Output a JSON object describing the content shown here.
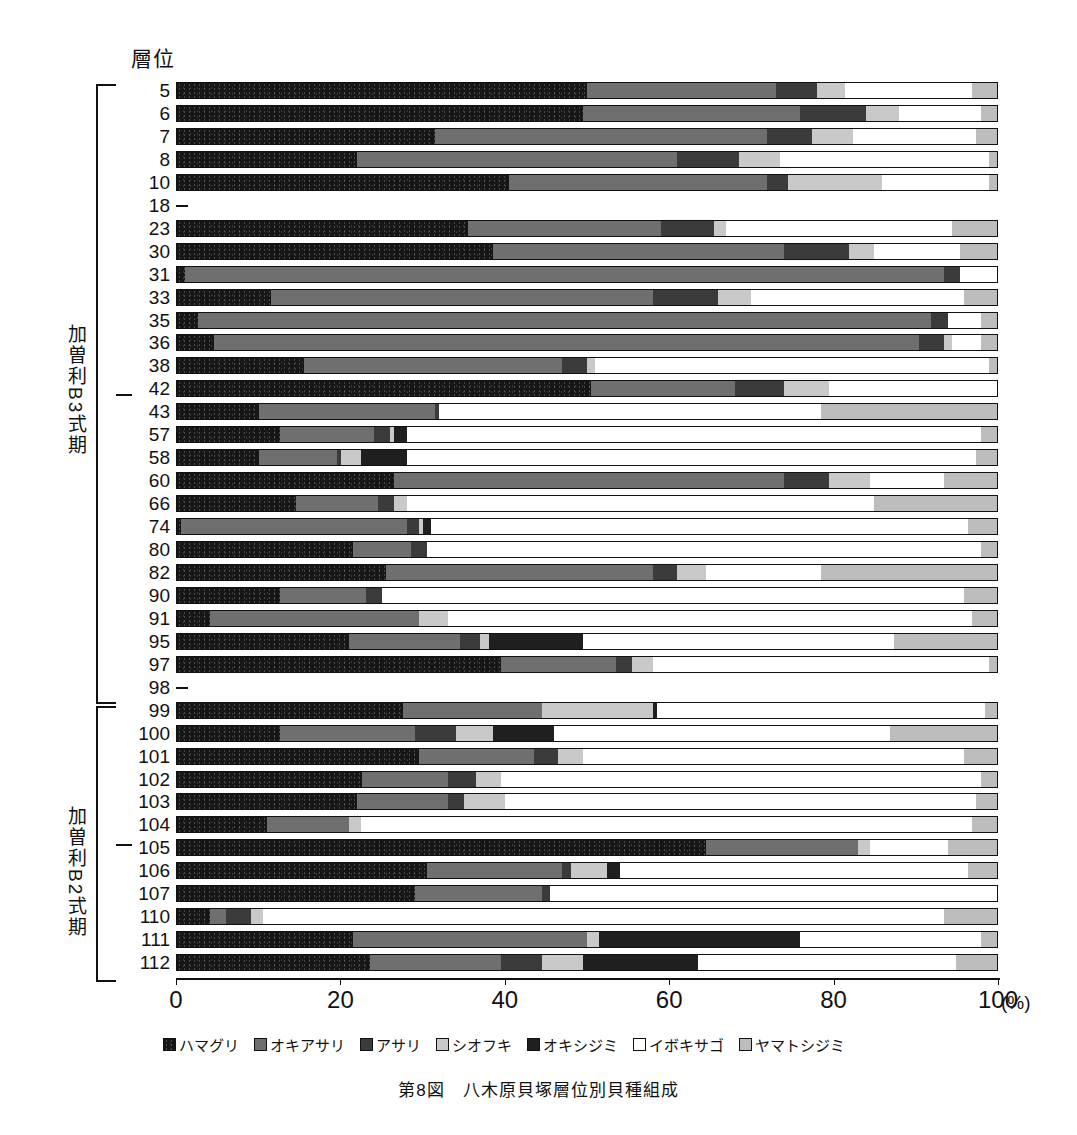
{
  "figure": {
    "axis_title": "層位",
    "caption": "第8図　八木原貝塚層位別貝種組成",
    "x_unit": "(%)"
  },
  "periods": [
    {
      "id": "kasori-b3",
      "label": "加曽利B3式期"
    },
    {
      "id": "kasori-b2",
      "label": "加曽利B2式期"
    }
  ],
  "axis": {
    "ticks": [
      "0",
      "20",
      "40",
      "60",
      "80",
      "100"
    ],
    "tick_values": [
      0,
      20,
      40,
      60,
      80,
      100
    ]
  },
  "legend": [
    {
      "name": "ハマグリ",
      "color": "#161616"
    },
    {
      "name": "オキアサリ",
      "color": "#6f6f6f"
    },
    {
      "name": "アサリ",
      "color": "#3b3b3b"
    },
    {
      "name": "シオフキ",
      "color": "#c9c9c9"
    },
    {
      "name": "オキシジミ",
      "color": "#1f1f1f"
    },
    {
      "name": "イボキサゴ",
      "color": "#ffffff"
    },
    {
      "name": "ヤマトシジミ",
      "color": "#bdbdbd"
    }
  ],
  "chart_data": {
    "type": "bar",
    "orientation": "horizontal",
    "stacked": true,
    "normalized_percent": true,
    "title": "第8図　八木原貝塚層位別貝種組成",
    "xlabel": "(%)",
    "ylabel": "層位",
    "xlim": [
      0,
      100
    ],
    "grid": false,
    "legend_position": "bottom",
    "categories": [
      "5",
      "6",
      "7",
      "8",
      "10",
      "18",
      "23",
      "30",
      "31",
      "33",
      "35",
      "36",
      "38",
      "42",
      "43",
      "57",
      "58",
      "60",
      "66",
      "74",
      "80",
      "82",
      "90",
      "91",
      "95",
      "97",
      "98",
      "99",
      "100",
      "101",
      "102",
      "103",
      "104",
      "105",
      "106",
      "107",
      "110",
      "111",
      "112"
    ],
    "series": [
      {
        "name": "ハマグリ",
        "values": [
          50.0,
          49.5,
          31.5,
          22.0,
          40.5,
          0,
          35.5,
          38.5,
          1.0,
          11.5,
          2.5,
          4.5,
          15.5,
          50.5,
          10.0,
          12.5,
          10.0,
          26.5,
          14.5,
          0.5,
          21.5,
          25.5,
          12.5,
          4.0,
          21.0,
          39.5,
          0,
          27.5,
          12.5,
          29.5,
          22.5,
          22.0,
          11.0,
          64.5,
          30.5,
          29.0,
          4.0,
          21.5,
          23.5
        ]
      },
      {
        "name": "オキアサリ",
        "values": [
          23.0,
          26.5,
          40.5,
          39.0,
          31.5,
          0,
          23.5,
          35.5,
          92.5,
          46.5,
          89.5,
          86.0,
          31.5,
          17.5,
          21.5,
          11.5,
          9.5,
          47.5,
          10.0,
          27.5,
          7.0,
          32.5,
          10.5,
          25.5,
          13.5,
          14.0,
          0,
          17.0,
          16.5,
          14.0,
          10.5,
          11.0,
          10.0,
          18.5,
          16.5,
          15.5,
          2.0,
          28.5,
          16.0
        ]
      },
      {
        "name": "アサリ",
        "values": [
          5.0,
          8.0,
          5.5,
          7.5,
          2.5,
          0,
          6.5,
          8.0,
          2.0,
          8.0,
          2.0,
          3.0,
          3.0,
          6.0,
          0.5,
          2.0,
          0.5,
          5.5,
          2.0,
          1.5,
          2.0,
          3.0,
          2.0,
          0.0,
          2.5,
          2.0,
          0,
          0.0,
          5.0,
          3.0,
          3.5,
          2.0,
          0.0,
          0.0,
          1.0,
          1.0,
          3.0,
          0.0,
          5.0
        ]
      },
      {
        "name": "シオフキ",
        "values": [
          3.5,
          4.0,
          5.0,
          5.0,
          11.5,
          0,
          1.5,
          3.0,
          0.0,
          4.0,
          0.0,
          1.0,
          1.0,
          5.5,
          0.0,
          0.5,
          2.5,
          5.0,
          1.5,
          0.5,
          0.0,
          3.5,
          0.0,
          3.5,
          1.0,
          2.5,
          0,
          13.5,
          4.5,
          3.0,
          3.0,
          5.0,
          1.5,
          1.5,
          4.5,
          0.0,
          1.5,
          1.5,
          5.0
        ]
      },
      {
        "name": "オキシジミ",
        "values": [
          0.0,
          0.0,
          0.0,
          0.0,
          0.0,
          0,
          0.0,
          0.0,
          0.0,
          0.0,
          0.0,
          0.0,
          0.0,
          0.0,
          0.0,
          1.5,
          5.5,
          0.0,
          0.0,
          1.0,
          0.0,
          0.0,
          0.0,
          0.0,
          11.5,
          0.0,
          0,
          0.5,
          7.5,
          0.0,
          0.0,
          0.0,
          0.0,
          0.0,
          1.5,
          0.0,
          0.0,
          24.5,
          14.0
        ]
      },
      {
        "name": "イボキサゴ",
        "values": [
          15.5,
          10.0,
          15.0,
          25.5,
          13.0,
          0,
          27.5,
          10.5,
          4.5,
          26.0,
          4.0,
          3.5,
          48.0,
          20.5,
          46.5,
          70.0,
          69.5,
          9.0,
          57.0,
          65.5,
          67.5,
          14.0,
          71.0,
          64.0,
          38.0,
          41.0,
          0,
          40.0,
          41.0,
          46.5,
          58.5,
          57.5,
          74.5,
          9.5,
          42.5,
          54.5,
          83.0,
          22.0,
          31.5
        ]
      },
      {
        "name": "ヤマトシジミ",
        "values": [
          3.0,
          2.0,
          2.5,
          1.0,
          1.0,
          0,
          5.5,
          4.5,
          0.0,
          4.0,
          2.0,
          2.0,
          1.0,
          0.0,
          21.5,
          2.0,
          2.5,
          6.5,
          15.0,
          3.5,
          2.0,
          21.5,
          4.0,
          3.0,
          12.5,
          1.0,
          0,
          1.5,
          13.0,
          4.0,
          2.0,
          2.5,
          3.0,
          6.0,
          3.5,
          0.0,
          6.5,
          2.0,
          5.0
        ]
      }
    ],
    "empty_categories": [
      "18",
      "98"
    ]
  },
  "rows": [
    {
      "layer": "5",
      "segments": [
        50.0,
        23.0,
        5.0,
        3.5,
        0.0,
        15.5,
        3.0
      ]
    },
    {
      "layer": "6",
      "segments": [
        49.5,
        26.5,
        8.0,
        4.0,
        0.0,
        10.0,
        2.0
      ]
    },
    {
      "layer": "7",
      "segments": [
        31.5,
        40.5,
        5.5,
        5.0,
        0.0,
        15.0,
        2.5
      ]
    },
    {
      "layer": "8",
      "segments": [
        22.0,
        39.0,
        7.5,
        5.0,
        0.0,
        25.5,
        1.0
      ]
    },
    {
      "layer": "10",
      "segments": [
        40.5,
        31.5,
        2.5,
        11.5,
        0.0,
        13.0,
        1.0
      ]
    },
    {
      "layer": "18",
      "segments": []
    },
    {
      "layer": "23",
      "segments": [
        35.5,
        23.5,
        6.5,
        1.5,
        0.0,
        27.5,
        5.5
      ]
    },
    {
      "layer": "30",
      "segments": [
        38.5,
        35.5,
        8.0,
        3.0,
        0.0,
        10.5,
        4.5
      ]
    },
    {
      "layer": "31",
      "segments": [
        1.0,
        92.5,
        2.0,
        0.0,
        0.0,
        4.5,
        0.0
      ]
    },
    {
      "layer": "33",
      "segments": [
        11.5,
        46.5,
        8.0,
        4.0,
        0.0,
        26.0,
        4.0
      ]
    },
    {
      "layer": "35",
      "segments": [
        2.5,
        89.5,
        2.0,
        0.0,
        0.0,
        4.0,
        2.0
      ]
    },
    {
      "layer": "36",
      "segments": [
        4.5,
        86.0,
        3.0,
        1.0,
        0.0,
        3.5,
        2.0
      ]
    },
    {
      "layer": "38",
      "segments": [
        15.5,
        31.5,
        3.0,
        1.0,
        0.0,
        48.0,
        1.0
      ]
    },
    {
      "layer": "42",
      "segments": [
        50.5,
        17.5,
        6.0,
        5.5,
        0.0,
        20.5,
        0.0
      ]
    },
    {
      "layer": "43",
      "segments": [
        10.0,
        21.5,
        0.5,
        0.0,
        0.0,
        46.5,
        21.5
      ]
    },
    {
      "layer": "57",
      "segments": [
        12.5,
        11.5,
        2.0,
        0.5,
        1.5,
        70.0,
        2.0
      ]
    },
    {
      "layer": "58",
      "segments": [
        10.0,
        9.5,
        0.5,
        2.5,
        5.5,
        69.5,
        2.5
      ]
    },
    {
      "layer": "60",
      "segments": [
        26.5,
        47.5,
        5.5,
        5.0,
        0.0,
        9.0,
        6.5
      ]
    },
    {
      "layer": "66",
      "segments": [
        14.5,
        10.0,
        2.0,
        1.5,
        0.0,
        57.0,
        15.0
      ]
    },
    {
      "layer": "74",
      "segments": [
        0.5,
        27.5,
        1.5,
        0.5,
        1.0,
        65.5,
        3.5
      ]
    },
    {
      "layer": "80",
      "segments": [
        21.5,
        7.0,
        2.0,
        0.0,
        0.0,
        67.5,
        2.0
      ]
    },
    {
      "layer": "82",
      "segments": [
        25.5,
        32.5,
        3.0,
        3.5,
        0.0,
        14.0,
        21.5
      ]
    },
    {
      "layer": "90",
      "segments": [
        12.5,
        10.5,
        2.0,
        0.0,
        0.0,
        71.0,
        4.0
      ]
    },
    {
      "layer": "91",
      "segments": [
        4.0,
        25.5,
        0.0,
        3.5,
        0.0,
        64.0,
        3.0
      ]
    },
    {
      "layer": "95",
      "segments": [
        21.0,
        13.5,
        2.5,
        1.0,
        11.5,
        38.0,
        12.5
      ]
    },
    {
      "layer": "97",
      "segments": [
        39.5,
        14.0,
        2.0,
        2.5,
        0.0,
        41.0,
        1.0
      ]
    },
    {
      "layer": "98",
      "segments": []
    },
    {
      "layer": "99",
      "segments": [
        27.5,
        17.0,
        0.0,
        13.5,
        0.5,
        40.0,
        1.5
      ]
    },
    {
      "layer": "100",
      "segments": [
        12.5,
        16.5,
        5.0,
        4.5,
        7.5,
        41.0,
        13.0
      ]
    },
    {
      "layer": "101",
      "segments": [
        29.5,
        14.0,
        3.0,
        3.0,
        0.0,
        46.5,
        4.0
      ]
    },
    {
      "layer": "102",
      "segments": [
        22.5,
        10.5,
        3.5,
        3.0,
        0.0,
        58.5,
        2.0
      ]
    },
    {
      "layer": "103",
      "segments": [
        22.0,
        11.0,
        2.0,
        5.0,
        0.0,
        57.5,
        2.5
      ]
    },
    {
      "layer": "104",
      "segments": [
        11.0,
        10.0,
        0.0,
        1.5,
        0.0,
        74.5,
        3.0
      ]
    },
    {
      "layer": "105",
      "segments": [
        64.5,
        18.5,
        0.0,
        1.5,
        0.0,
        9.5,
        6.0
      ]
    },
    {
      "layer": "106",
      "segments": [
        30.5,
        16.5,
        1.0,
        4.5,
        1.5,
        42.5,
        3.5
      ]
    },
    {
      "layer": "107",
      "segments": [
        29.0,
        15.5,
        1.0,
        0.0,
        0.0,
        54.5,
        0.0
      ]
    },
    {
      "layer": "110",
      "segments": [
        4.0,
        2.0,
        3.0,
        1.5,
        0.0,
        83.0,
        6.5
      ]
    },
    {
      "layer": "111",
      "segments": [
        21.5,
        28.5,
        0.0,
        1.5,
        24.5,
        22.0,
        2.0
      ]
    },
    {
      "layer": "112",
      "segments": [
        23.5,
        16.0,
        5.0,
        5.0,
        14.0,
        31.5,
        5.0
      ]
    }
  ]
}
